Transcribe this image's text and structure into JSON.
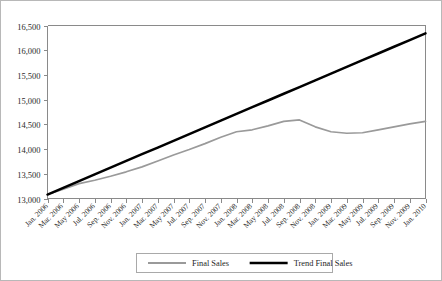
{
  "chart_data": {
    "type": "line",
    "title": "",
    "xlabel": "",
    "ylabel": "",
    "ylim": [
      13000,
      16500
    ],
    "ytick_values": [
      13000,
      13500,
      14000,
      14500,
      15000,
      15500,
      16000,
      16500
    ],
    "ytick_labels": [
      "13,000",
      "13,500",
      "14,000",
      "14,500",
      "15,000",
      "15,500",
      "16,000",
      "16,500"
    ],
    "grid": false,
    "legend_position": "bottom-center",
    "categories": [
      "Jan. 2006",
      "Mar. 2006",
      "May 2006",
      "Jul. 2006",
      "Sep. 2006",
      "Nov. 2006",
      "Jan. 2007",
      "Mar. 2007",
      "May 2007",
      "Jul. 2007",
      "Sep. 2007",
      "Nov. 2007",
      "Jan. 2008",
      "Mar. 2008",
      "May 2008",
      "Jul. 2008",
      "Sep. 2008",
      "Nov. 2008",
      "Jan. 2009",
      "Mar. 2009",
      "May 2009",
      "Jul. 2009",
      "Sep. 2009",
      "Nov. 2009",
      "Jan. 2010"
    ],
    "series": [
      {
        "name": "Final Sales",
        "color": "#9a9a9a",
        "width": 1.7,
        "values": [
          13080,
          13190,
          13300,
          13370,
          13450,
          13540,
          13640,
          13760,
          13880,
          13990,
          14110,
          14240,
          14350,
          14390,
          14470,
          14560,
          14590,
          14450,
          14350,
          14320,
          14330,
          14390,
          14450,
          14510,
          14560
        ]
      },
      {
        "name": "Trend Final Sales",
        "color": "#000000",
        "width": 2.5,
        "values": [
          13080,
          13216,
          13352,
          13488,
          13624,
          13760,
          13896,
          14031,
          14167,
          14303,
          14439,
          14575,
          14711,
          14847,
          14983,
          15119,
          15254,
          15390,
          15526,
          15662,
          15798,
          15934,
          16070,
          16206,
          16340
        ]
      }
    ]
  },
  "legend": {
    "items": [
      {
        "label": "Final Sales",
        "color": "#9a9a9a",
        "width": 1.8
      },
      {
        "label": "Trend Final Sales",
        "color": "#000000",
        "width": 2.6
      }
    ]
  }
}
